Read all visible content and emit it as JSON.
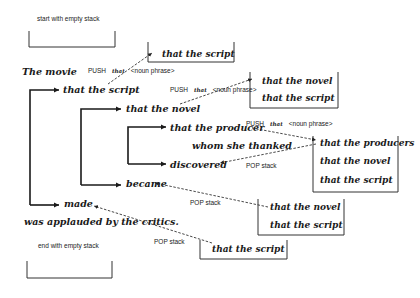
{
  "captions": {
    "start": "start with empty stack",
    "end": "end with empty stack"
  },
  "sentence": {
    "subject": "The movie",
    "rel1": "that the script",
    "rel2": "that the novel",
    "rel3": "that the producer",
    "rel3_clause": "whom she thanked",
    "verb3": "discovered",
    "verb2": "became",
    "verb1": "made",
    "predicate": "was applauded by the critics."
  },
  "operations": {
    "push1": {
      "op": "PUSH",
      "word": "that",
      "arg": "<noun phrase>"
    },
    "push2": {
      "op": "PUSH",
      "word": "that",
      "arg": "<noun phrase>"
    },
    "push3": {
      "op": "PUSH",
      "word": "that",
      "arg": "<noun phrase>"
    },
    "pop1": "POP stack",
    "pop2": "POP stack",
    "pop3": "POP stack"
  },
  "stacks": {
    "s1": [
      "that the script"
    ],
    "s2": [
      "that the novel",
      "that the script"
    ],
    "s3": [
      "that the producers",
      "that the novel",
      "that the script"
    ],
    "s4": [
      "that the novel",
      "that the script"
    ],
    "s5": [
      "that the script"
    ]
  }
}
